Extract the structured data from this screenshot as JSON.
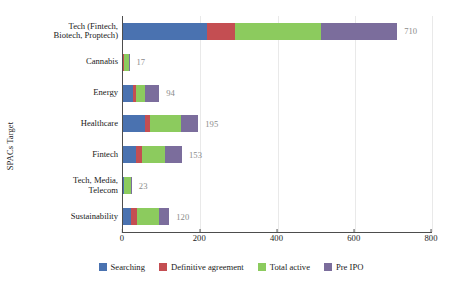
{
  "chart_data": {
    "type": "bar",
    "orientation": "horizontal",
    "stacked": true,
    "title": "",
    "xlabel": "",
    "ylabel": "SPACs Target",
    "xlim": [
      0,
      800
    ],
    "xticks": [
      0,
      200,
      400,
      600,
      800
    ],
    "grid": true,
    "legend_position": "bottom",
    "categories": [
      "Tech (Fintech,\nBiotech, Proptech)",
      "Cannabis",
      "Energy",
      "Healthcare",
      "Fintech",
      "Tech, Media,\nTelecom",
      "Sustainability"
    ],
    "series": [
      {
        "name": "Searching",
        "color": "#4a72b0",
        "values": [
          218,
          1,
          25,
          58,
          34,
          2,
          22
        ]
      },
      {
        "name": "Definitive agreement",
        "color": "#c44e52",
        "values": [
          73,
          1,
          8,
          12,
          14,
          1,
          15
        ]
      },
      {
        "name": "Total active",
        "color": "#8ccb5e",
        "values": [
          222,
          14,
          25,
          80,
          62,
          18,
          55
        ]
      },
      {
        "name": "Pre IPO",
        "color": "#7b6d9c",
        "values": [
          197,
          1,
          36,
          45,
          43,
          2,
          28
        ]
      }
    ],
    "totals": [
      710,
      17,
      94,
      195,
      153,
      23,
      120
    ],
    "total_labels": [
      "710",
      "17",
      "94",
      "195",
      "153",
      "23",
      "120"
    ],
    "total_label_color": "#8b8b8b"
  }
}
